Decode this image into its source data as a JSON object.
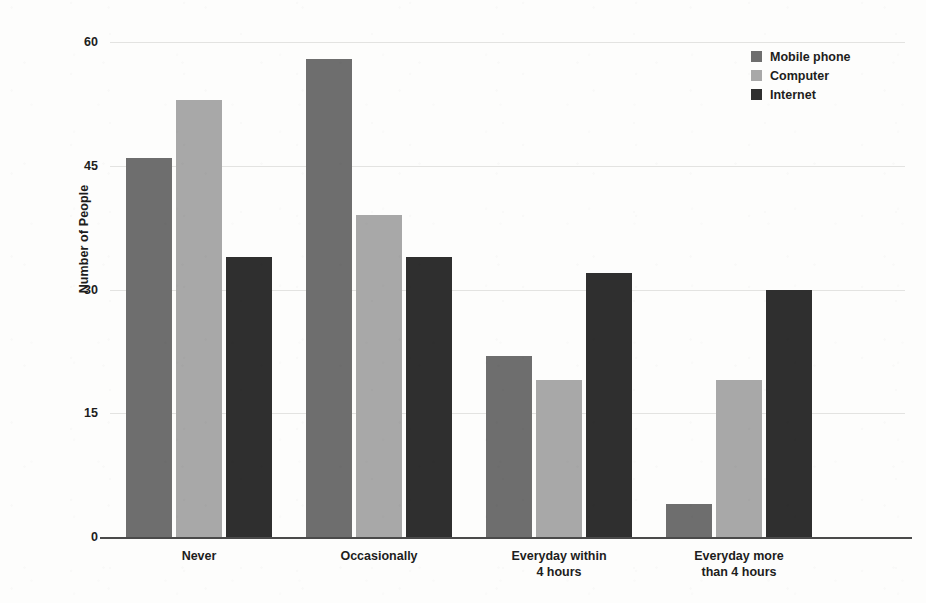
{
  "chart_data": {
    "type": "bar",
    "title": "",
    "xlabel": "",
    "ylabel": "Number of People",
    "ylim": [
      0,
      60
    ],
    "yticks": [
      0,
      15,
      30,
      45,
      60
    ],
    "ytick_labels": [
      "0",
      "15",
      "30",
      "45",
      "60"
    ],
    "grid": true,
    "legend_position": "top-right",
    "categories": [
      "Never",
      "Occasionally",
      "Everyday within\n4 hours",
      "Everyday more\nthan 4 hours"
    ],
    "series": [
      {
        "name": "Mobile phone",
        "color": "#6e6e6e",
        "values": [
          46,
          58,
          22,
          4
        ]
      },
      {
        "name": "Computer",
        "color": "#a8a8a8",
        "values": [
          53,
          39,
          19,
          19
        ]
      },
      {
        "name": "Internet",
        "color": "#2f2f2f",
        "values": [
          34,
          34,
          32,
          30
        ]
      }
    ]
  },
  "legend": {
    "items": [
      {
        "label": "Mobile phone"
      },
      {
        "label": "Computer"
      },
      {
        "label": "Internet"
      }
    ]
  }
}
